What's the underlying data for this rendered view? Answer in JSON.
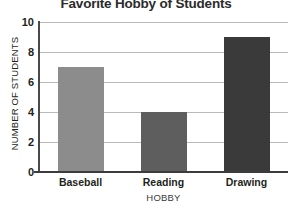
{
  "chart_data": {
    "type": "bar",
    "title": "Favorite Hobby of Students",
    "xlabel": "HOBBY",
    "ylabel": "NUMBER OF STUDENTS",
    "categories": [
      "Baseball",
      "Reading",
      "Drawing"
    ],
    "values": [
      7,
      4,
      9
    ],
    "bar_colors": [
      "#8c8c8c",
      "#5e5e5e",
      "#3a3a3a"
    ],
    "ylim": [
      0,
      10
    ],
    "yticks": [
      0,
      2,
      4,
      6,
      8,
      10
    ],
    "ytick_labels": [
      "0",
      "2",
      "4",
      "6",
      "8",
      "10"
    ],
    "grid": true,
    "grid_axis": "y",
    "grid_color": "#b9b9b9",
    "legend": false,
    "axis_color": "#3c3c3c",
    "background": "#ffffff"
  }
}
